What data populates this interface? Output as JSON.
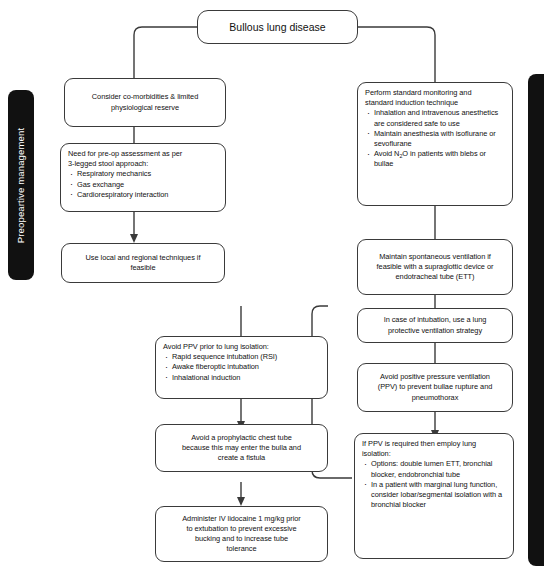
{
  "diagram": {
    "title": "Bullous lung disease",
    "sidebar_left": "Preopeartive management",
    "sidebar_right": ""
  },
  "nodes": {
    "left_1": {
      "lines": [
        "Consider co-morbidities & limited",
        "physiological reserve"
      ]
    },
    "left_2": {
      "lead": [
        "Need for pre-op assessment as per",
        "3-legged stool approach:"
      ],
      "bullets": [
        "Respiratory mechanics",
        "Gas exchange",
        "Cardiorespiratory interaction"
      ]
    },
    "left_3": {
      "lines": [
        "Use local and regional techniques if",
        "feasible"
      ]
    },
    "right_1": {
      "lead": [
        "Perform standard monitoring and",
        "standard induction technique"
      ],
      "bullets": [
        "Inhalation and intravenous anesthetics are considered safe to use",
        "Maintain anesthesia with isoflurane or sevoflurane",
        "Avoid N2O in patients with blebs or bullae"
      ],
      "bullet3_pre": "Avoid N",
      "bullet3_sub": "2",
      "bullet3_post": "O in patients with blebs or bullae"
    },
    "right_2": {
      "lines": [
        "Maintain spontaneous ventilation if",
        "feasible with a supraglottic device or",
        "endotracheal tube (ETT)"
      ]
    },
    "right_3": {
      "lines": [
        "In case of intubation, use a lung",
        "protective ventilation strategy"
      ]
    },
    "right_4": {
      "lines": [
        "Avoid positive pressure ventilation",
        "(PPV) to prevent bullae rupture and",
        "pneumothorax"
      ]
    },
    "right_5": {
      "lead": [
        "If PPV is required then employ lung",
        "isolation:"
      ],
      "bullets": [
        "Options: double lumen ETT, bronchial blocker, endobronchial tube",
        "In a patient with marginal lung function, consider lobar/segmental isolation with a bronchial blocker"
      ]
    },
    "mid_1": {
      "lead": [
        "Avoid PPV prior to lung isolation:"
      ],
      "bullets": [
        "Rapid sequence intubation (RSI)",
        "Awake fiberoptic intubation",
        "Inhalational induction"
      ]
    },
    "mid_2": {
      "lines": [
        "Avoid a prophylactic chest tube",
        "because this may enter the bulla and",
        "create a fistula"
      ]
    },
    "mid_3": {
      "lines": [
        "Administer IV lidocaine 1 mg/kg prior",
        "to extubation to prevent excessive",
        "bucking and to increase tube",
        "tolerance"
      ]
    }
  },
  "style": {
    "stroke": "#3a3a3a",
    "sidebar_bg": "#111111",
    "text": "#111111",
    "background": "#ffffff"
  }
}
